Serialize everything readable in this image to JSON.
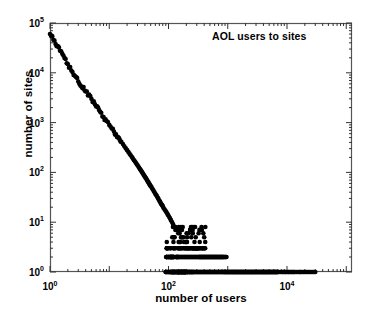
{
  "chart_data": {
    "type": "scatter",
    "title": "",
    "annotation": "AOL users to sites",
    "xlabel": "number of users",
    "ylabel": "number of sites",
    "xscale": "log",
    "yscale": "log",
    "xlim": [
      1,
      125000
    ],
    "ylim": [
      1,
      100000
    ],
    "grid": false,
    "legend": null,
    "marker": "filled-circle",
    "marker_color": "#000000",
    "marker_size_px": 4.6,
    "xticks_major": [
      1,
      100,
      10000
    ],
    "xtick_labels": [
      "10",
      "10",
      "10"
    ],
    "xtick_exponents": [
      "0",
      "2",
      "4"
    ],
    "xticks_minor_decades": [
      1,
      10,
      100,
      1000,
      10000,
      100000
    ],
    "yticks_major": [
      1,
      10,
      100,
      1000,
      10000,
      100000
    ],
    "ytick_labels": [
      "10",
      "10",
      "10",
      "10",
      "10",
      "10"
    ],
    "ytick_exponents": [
      "0",
      "1",
      "2",
      "3",
      "4",
      "5"
    ],
    "points": [
      [
        1,
        60000
      ],
      [
        2,
        15000
      ],
      [
        3,
        6700
      ],
      [
        4,
        4200
      ],
      [
        5,
        3000
      ],
      [
        6,
        2100
      ],
      [
        7,
        1650
      ],
      [
        8,
        1300
      ],
      [
        9,
        1080
      ],
      [
        10,
        900
      ],
      [
        11,
        760
      ],
      [
        12,
        660
      ],
      [
        13,
        580
      ],
      [
        14,
        510
      ],
      [
        15,
        455
      ],
      [
        16,
        410
      ],
      [
        17,
        370
      ],
      [
        18,
        335
      ],
      [
        19,
        305
      ],
      [
        20,
        280
      ],
      [
        21,
        258
      ],
      [
        22,
        238
      ],
      [
        23,
        221
      ],
      [
        24,
        205
      ],
      [
        25,
        191
      ],
      [
        26,
        178
      ],
      [
        27,
        167
      ],
      [
        28,
        157
      ],
      [
        29,
        147
      ],
      [
        30,
        139
      ],
      [
        31,
        131
      ],
      [
        32,
        124
      ],
      [
        33,
        117
      ],
      [
        34,
        111
      ],
      [
        35,
        105
      ],
      [
        36,
        100
      ],
      [
        37,
        95
      ],
      [
        38,
        90
      ],
      [
        39,
        86
      ],
      [
        40,
        82
      ],
      [
        41,
        78
      ],
      [
        42,
        75
      ],
      [
        43,
        71
      ],
      [
        44,
        68
      ],
      [
        45,
        65
      ],
      [
        46,
        63
      ],
      [
        47,
        60
      ],
      [
        48,
        58
      ],
      [
        49,
        55
      ],
      [
        50,
        53
      ],
      [
        52,
        50
      ],
      [
        54,
        46
      ],
      [
        56,
        43
      ],
      [
        58,
        40
      ],
      [
        60,
        37
      ],
      [
        62,
        35
      ],
      [
        64,
        33
      ],
      [
        66,
        31
      ],
      [
        68,
        29
      ],
      [
        70,
        27
      ],
      [
        72,
        26
      ],
      [
        74,
        24
      ],
      [
        76,
        23
      ],
      [
        78,
        22
      ],
      [
        80,
        21
      ],
      [
        83,
        19
      ],
      [
        86,
        18
      ],
      [
        89,
        17
      ],
      [
        92,
        16
      ],
      [
        95,
        15
      ],
      [
        98,
        14
      ],
      [
        102,
        13
      ],
      [
        106,
        12
      ],
      [
        110,
        11
      ],
      [
        115,
        10
      ],
      [
        120,
        9
      ],
      [
        126,
        8
      ],
      [
        132,
        8
      ],
      [
        139,
        7
      ],
      [
        146,
        6
      ],
      [
        154,
        6
      ],
      [
        163,
        5
      ],
      [
        172,
        5
      ],
      [
        182,
        4
      ],
      [
        193,
        4
      ],
      [
        205,
        4
      ],
      [
        218,
        3
      ],
      [
        232,
        3
      ],
      [
        247,
        3
      ],
      [
        263,
        3
      ],
      [
        280,
        3
      ],
      [
        300,
        3
      ],
      [
        320,
        3
      ],
      [
        345,
        2
      ],
      [
        370,
        2
      ],
      [
        400,
        2
      ],
      [
        430,
        2
      ],
      [
        465,
        2
      ],
      [
        500,
        2
      ],
      [
        545,
        2
      ],
      [
        590,
        2
      ],
      [
        640,
        2
      ],
      [
        700,
        2
      ],
      [
        760,
        2
      ],
      [
        830,
        2
      ],
      [
        900,
        1
      ],
      [
        1000,
        1
      ],
      [
        1100,
        1
      ],
      [
        1250,
        1
      ],
      [
        1400,
        1
      ],
      [
        1600,
        1
      ],
      [
        1800,
        1
      ],
      [
        2100,
        1
      ],
      [
        2400,
        1
      ],
      [
        2800,
        1
      ],
      [
        3200,
        1
      ],
      [
        3700,
        1
      ],
      [
        4300,
        1
      ],
      [
        5000,
        1
      ],
      [
        6000,
        1
      ],
      [
        7000,
        1
      ],
      [
        9000,
        1
      ],
      [
        11000,
        1
      ],
      [
        12000,
        1
      ],
      [
        13000,
        1
      ],
      [
        30000,
        1
      ]
    ]
  }
}
